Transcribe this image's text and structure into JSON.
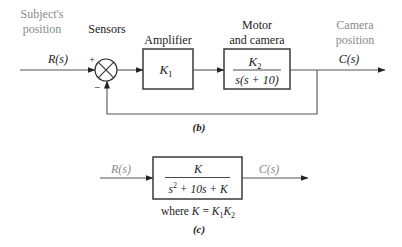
{
  "figure_b": {
    "input_label_line1": "Subject's",
    "input_label_line2": "position",
    "input_signal": "R(s)",
    "sensors_label": "Sensors",
    "plus_sign": "+",
    "minus_sign": "−",
    "amplifier_label": "Amplifier",
    "amplifier_gain": "K",
    "amplifier_gain_sub": "1",
    "motor_label_line1": "Motor",
    "motor_label_line2": "and camera",
    "motor_num": "K",
    "motor_num_sub": "2",
    "motor_den": "s(s + 10)",
    "output_label_line1": "Camera",
    "output_label_line2": "position",
    "output_signal": "C(s)",
    "caption": "(b)"
  },
  "figure_c": {
    "input_signal": "R(s)",
    "output_signal": "C(s)",
    "tf_num": "K",
    "tf_den_s": "s",
    "tf_den_exp": "2",
    "tf_den_rest": " + 10s + K",
    "where_prefix": "where ",
    "where_K": "K",
    "where_eq": " = ",
    "where_K1": "K",
    "where_K1_sub": "1",
    "where_K2": "K",
    "where_K2_sub": "2",
    "caption": "(c)"
  },
  "colors": {
    "annotation_gray": "#8a8a8a",
    "text_dark": "#222222",
    "line": "#555555"
  }
}
